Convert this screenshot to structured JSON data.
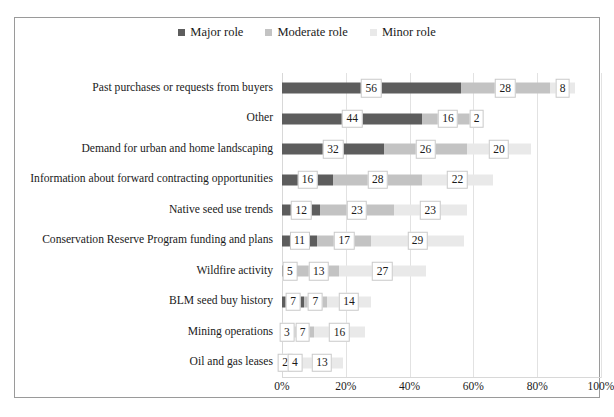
{
  "chart_data": {
    "type": "bar",
    "orientation": "horizontal",
    "stacked": true,
    "title": "",
    "xlabel": "",
    "ylabel": "",
    "xlim": [
      0,
      100
    ],
    "grid": true,
    "legend_position": "top-center",
    "tick_labels": [
      "0%",
      "20%",
      "40%",
      "60%",
      "80%",
      "100%"
    ],
    "tick_values": [
      0,
      20,
      40,
      60,
      80,
      100
    ],
    "categories": [
      "Past purchases or requests from buyers",
      "Other",
      "Demand for urban and home landscaping",
      "Information about forward contracting opportunities",
      "Native seed use trends",
      "Conservation Reserve Program funding and plans",
      "Wildfire activity",
      "BLM seed buy history",
      "Mining operations",
      "Oil and gas leases"
    ],
    "series": [
      {
        "name": "Major role",
        "color": "#5d5d5d",
        "values": [
          56,
          44,
          32,
          16,
          12,
          11,
          5,
          7,
          3,
          2
        ]
      },
      {
        "name": "Moderate role",
        "color": "#c3c3c3",
        "values": [
          28,
          16,
          26,
          28,
          23,
          17,
          13,
          7,
          7,
          4
        ]
      },
      {
        "name": "Minor role",
        "color": "#e9e9e9",
        "values": [
          8,
          2,
          20,
          22,
          23,
          29,
          27,
          14,
          16,
          13
        ]
      }
    ]
  },
  "legend": {
    "items": [
      {
        "label": "Major role",
        "color": "#5d5d5d",
        "marker": "square-marker"
      },
      {
        "label": "Moderate role",
        "color": "#c3c3c3",
        "marker": "square-marker"
      },
      {
        "label": "Minor role",
        "color": "#e9e9e9",
        "marker": "square-marker"
      }
    ]
  }
}
